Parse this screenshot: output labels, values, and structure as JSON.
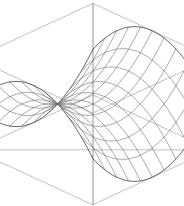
{
  "figure": {
    "title": "",
    "background_color": "#ffffff",
    "width": 184,
    "height": 206
  },
  "style": {
    "mesh_color": "#6e6e6e",
    "mesh_border_color": "#4a4a4a",
    "box_color": "#8e8e8e",
    "mesh_line_width": 0.6,
    "box_line_width": 0.55
  },
  "chart_data": {
    "type": "line",
    "plot_kind": "wireframe-surface-3d",
    "title": "",
    "xlabel": "",
    "ylabel": "",
    "zlabel": "",
    "grid": false,
    "legend": "none",
    "axes_visible": false,
    "tick_labels": [],
    "surface": {
      "equation": "z = x^2 - y^2",
      "name": "hyperbolic paraboloid",
      "xlim": [
        -1,
        1
      ],
      "ylim": [
        -1,
        1
      ],
      "zlim": [
        -1,
        1
      ],
      "u_divisions": 10,
      "v_divisions": 10
    },
    "projection": {
      "type": "oblique-perspective",
      "azimuth_deg": 45,
      "elevation_deg": 22,
      "scale": 74,
      "origin_px": [
        93,
        104
      ]
    },
    "bounding_box_vertices_px": {
      "top_apex": [
        92,
        11
      ],
      "left": [
        9,
        60
      ],
      "right": [
        172,
        62
      ],
      "upper_mid": [
        93,
        104
      ],
      "lower_left": [
        33,
        159
      ],
      "lower_right": [
        157,
        159
      ],
      "bottom_apex": [
        95,
        196
      ]
    },
    "series": [
      {
        "name": "u-isolines",
        "count": 11
      },
      {
        "name": "v-isolines",
        "count": 11
      }
    ]
  }
}
